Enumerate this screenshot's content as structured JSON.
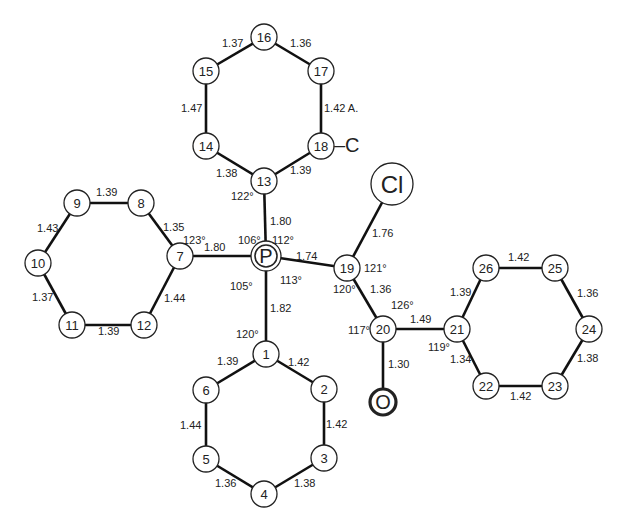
{
  "diagram": {
    "type": "molecular-structure",
    "central_atom": "P",
    "atoms": [
      {
        "id": "P",
        "label": "P",
        "x": 266,
        "y": 256,
        "r": 15,
        "style": "double"
      },
      {
        "id": "1",
        "label": "1",
        "x": 266,
        "y": 354,
        "r": 13
      },
      {
        "id": "2",
        "label": "2",
        "x": 324,
        "y": 389,
        "r": 13
      },
      {
        "id": "3",
        "label": "3",
        "x": 324,
        "y": 458,
        "r": 13
      },
      {
        "id": "4",
        "label": "4",
        "x": 264,
        "y": 494,
        "r": 13
      },
      {
        "id": "5",
        "label": "5",
        "x": 206,
        "y": 459,
        "r": 13
      },
      {
        "id": "6",
        "label": "6",
        "x": 206,
        "y": 390,
        "r": 13
      },
      {
        "id": "7",
        "label": "7",
        "x": 180,
        "y": 256,
        "r": 13
      },
      {
        "id": "8",
        "label": "8",
        "x": 141,
        "y": 203,
        "r": 13
      },
      {
        "id": "9",
        "label": "9",
        "x": 77,
        "y": 203,
        "r": 13
      },
      {
        "id": "10",
        "label": "10",
        "x": 38,
        "y": 263,
        "r": 13
      },
      {
        "id": "11",
        "label": "11",
        "x": 72,
        "y": 325,
        "r": 13
      },
      {
        "id": "12",
        "label": "12",
        "x": 144,
        "y": 325,
        "r": 13
      },
      {
        "id": "13",
        "label": "13",
        "x": 264,
        "y": 181,
        "r": 13
      },
      {
        "id": "14",
        "label": "14",
        "x": 206,
        "y": 146,
        "r": 13
      },
      {
        "id": "15",
        "label": "15",
        "x": 206,
        "y": 71,
        "r": 13
      },
      {
        "id": "16",
        "label": "16",
        "x": 264,
        "y": 37,
        "r": 13
      },
      {
        "id": "17",
        "label": "17",
        "x": 321,
        "y": 71,
        "r": 13
      },
      {
        "id": "18",
        "label": "18",
        "x": 321,
        "y": 146,
        "r": 13
      },
      {
        "id": "19",
        "label": "19",
        "x": 347,
        "y": 268,
        "r": 13
      },
      {
        "id": "20",
        "label": "20",
        "x": 383,
        "y": 329,
        "r": 13
      },
      {
        "id": "21",
        "label": "21",
        "x": 457,
        "y": 329,
        "r": 13
      },
      {
        "id": "22",
        "label": "22",
        "x": 486,
        "y": 386,
        "r": 13
      },
      {
        "id": "23",
        "label": "23",
        "x": 555,
        "y": 386,
        "r": 13
      },
      {
        "id": "24",
        "label": "24",
        "x": 589,
        "y": 329,
        "r": 13
      },
      {
        "id": "25",
        "label": "25",
        "x": 555,
        "y": 268,
        "r": 13
      },
      {
        "id": "26",
        "label": "26",
        "x": 486,
        "y": 268,
        "r": 13
      },
      {
        "id": "Cl",
        "label": "Cl",
        "x": 392,
        "y": 184,
        "r": 21
      },
      {
        "id": "O",
        "label": "O",
        "x": 383,
        "y": 402,
        "r": 13,
        "style": "bold"
      }
    ],
    "bonds": [
      {
        "a": "P",
        "b": "13",
        "length": "1.80",
        "lx": 270,
        "ly": 225
      },
      {
        "a": "P",
        "b": "7",
        "length": "1.80",
        "lx": 204,
        "ly": 251
      },
      {
        "a": "P",
        "b": "1",
        "length": "1.82",
        "lx": 270,
        "ly": 312
      },
      {
        "a": "P",
        "b": "19",
        "length": "1.74",
        "lx": 296,
        "ly": 260
      },
      {
        "a": "19",
        "b": "Cl",
        "length": "1.76",
        "lx": 372,
        "ly": 237
      },
      {
        "a": "19",
        "b": "20",
        "length": "1.36",
        "lx": 370,
        "ly": 293
      },
      {
        "a": "20",
        "b": "21",
        "length": "1.49",
        "lx": 410,
        "ly": 323
      },
      {
        "a": "20",
        "b": "O",
        "length": "1.30",
        "lx": 388,
        "ly": 368
      },
      {
        "a": "13",
        "b": "14",
        "length": "1.38",
        "lx": 216,
        "ly": 177
      },
      {
        "a": "14",
        "b": "15",
        "length": "1.47",
        "lx": 181,
        "ly": 112
      },
      {
        "a": "15",
        "b": "16",
        "length": "1.37",
        "lx": 222,
        "ly": 47
      },
      {
        "a": "16",
        "b": "17",
        "length": "1.36",
        "lx": 290,
        "ly": 47
      },
      {
        "a": "17",
        "b": "18",
        "length": "1.42 A.",
        "lx": 324,
        "ly": 112
      },
      {
        "a": "18",
        "b": "13",
        "length": "1.39",
        "lx": 290,
        "ly": 174
      },
      {
        "a": "7",
        "b": "8",
        "length": "1.35",
        "lx": 163,
        "ly": 231
      },
      {
        "a": "8",
        "b": "9",
        "length": "1.39",
        "lx": 96,
        "ly": 196
      },
      {
        "a": "9",
        "b": "10",
        "length": "1.43",
        "lx": 37,
        "ly": 232
      },
      {
        "a": "10",
        "b": "11",
        "length": "1.37",
        "lx": 32,
        "ly": 301
      },
      {
        "a": "11",
        "b": "12",
        "length": "1.39",
        "lx": 98,
        "ly": 335
      },
      {
        "a": "12",
        "b": "7",
        "length": "1.44",
        "lx": 164,
        "ly": 302
      },
      {
        "a": "1",
        "b": "2",
        "length": "1.42",
        "lx": 288,
        "ly": 366
      },
      {
        "a": "2",
        "b": "3",
        "length": "1.42",
        "lx": 326,
        "ly": 428
      },
      {
        "a": "3",
        "b": "4",
        "length": "1.38",
        "lx": 294,
        "ly": 487
      },
      {
        "a": "4",
        "b": "5",
        "length": "1.36",
        "lx": 215,
        "ly": 487
      },
      {
        "a": "5",
        "b": "6",
        "length": "1.44",
        "lx": 180,
        "ly": 429
      },
      {
        "a": "6",
        "b": "1",
        "length": "1.39",
        "lx": 217,
        "ly": 365
      },
      {
        "a": "21",
        "b": "26",
        "length": "1.39",
        "lx": 450,
        "ly": 296
      },
      {
        "a": "26",
        "b": "25",
        "length": "1.42",
        "lx": 508,
        "ly": 261
      },
      {
        "a": "25",
        "b": "24",
        "length": "1.36",
        "lx": 577,
        "ly": 297
      },
      {
        "a": "24",
        "b": "23",
        "length": "1.38",
        "lx": 577,
        "ly": 362
      },
      {
        "a": "23",
        "b": "22",
        "length": "1.42",
        "lx": 510,
        "ly": 400
      },
      {
        "a": "22",
        "b": "21",
        "length": "1.34",
        "lx": 450,
        "ly": 363
      }
    ],
    "angles": [
      {
        "label": "122°",
        "x": 231,
        "y": 200
      },
      {
        "label": "106°",
        "x": 238,
        "y": 244
      },
      {
        "label": "112°",
        "x": 272,
        "y": 244
      },
      {
        "label": "113°",
        "x": 280,
        "y": 284
      },
      {
        "label": "105°",
        "x": 230,
        "y": 290
      },
      {
        "label": "120°",
        "x": 236,
        "y": 338
      },
      {
        "label": "123°",
        "x": 183,
        "y": 244
      },
      {
        "label": "121°",
        "x": 364,
        "y": 272
      },
      {
        "label": "120°",
        "x": 333,
        "y": 293
      },
      {
        "label": "126°",
        "x": 391,
        "y": 309
      },
      {
        "label": "117°",
        "x": 348,
        "y": 334
      },
      {
        "label": "119°",
        "x": 428,
        "y": 351
      }
    ],
    "substituent": {
      "label": "–C",
      "x": 334,
      "y": 152
    }
  }
}
